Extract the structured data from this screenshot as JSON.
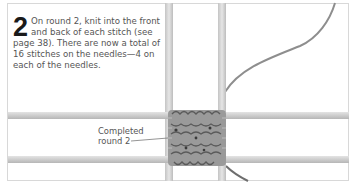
{
  "step": {
    "number": "2",
    "text": "On round 2, knit into the front and back of each stitch (see page 38). There are now a total of 16 stitches on the needles—4 on each of the needles."
  },
  "illustration": {
    "callout_line1": "Completed",
    "callout_line2": "round 2",
    "needle_color": "#d2d2d2",
    "yarn_color": "#8e8e8e",
    "knit_color": "#8a8a8a"
  }
}
